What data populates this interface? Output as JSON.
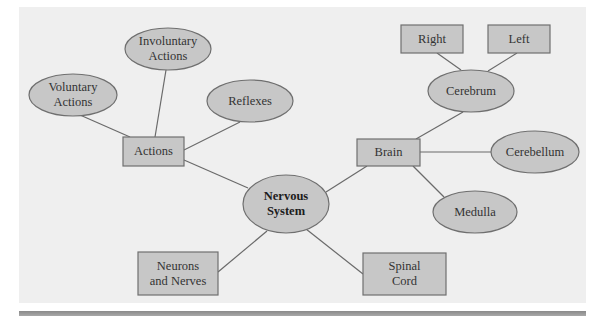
{
  "diagram": {
    "type": "concept-map",
    "colors": {
      "panel_bg": "#efefef",
      "node_fill": "#c7c7c7",
      "node_stroke": "#6f6f6f",
      "edge": "#6a6a6a",
      "bottom_rule": "#999999"
    },
    "nodes": {
      "nervous_system": {
        "shape": "ellipse",
        "line1": "Nervous",
        "line2": "System",
        "bold": true
      },
      "actions": {
        "shape": "rect",
        "line1": "Actions"
      },
      "voluntary_actions": {
        "shape": "ellipse",
        "line1": "Voluntary",
        "line2": "Actions"
      },
      "involuntary_actions": {
        "shape": "ellipse",
        "line1": "Involuntary",
        "line2": "Actions"
      },
      "reflexes": {
        "shape": "ellipse",
        "line1": "Reflexes"
      },
      "brain": {
        "shape": "rect",
        "line1": "Brain"
      },
      "cerebrum": {
        "shape": "ellipse",
        "line1": "Cerebrum"
      },
      "right": {
        "shape": "rect",
        "line1": "Right"
      },
      "left": {
        "shape": "rect",
        "line1": "Left"
      },
      "cerebellum": {
        "shape": "ellipse",
        "line1": "Cerebellum"
      },
      "medulla": {
        "shape": "ellipse",
        "line1": "Medulla"
      },
      "neurons_and_nerves": {
        "shape": "rect",
        "line1": "Neurons",
        "line2": "and Nerves"
      },
      "spinal_cord": {
        "shape": "rect",
        "line1": "Spinal",
        "line2": "Cord"
      }
    },
    "edges": [
      [
        "nervous_system",
        "actions"
      ],
      [
        "nervous_system",
        "brain"
      ],
      [
        "nervous_system",
        "neurons_and_nerves"
      ],
      [
        "nervous_system",
        "spinal_cord"
      ],
      [
        "actions",
        "voluntary_actions"
      ],
      [
        "actions",
        "involuntary_actions"
      ],
      [
        "actions",
        "reflexes"
      ],
      [
        "brain",
        "cerebrum"
      ],
      [
        "brain",
        "cerebellum"
      ],
      [
        "brain",
        "medulla"
      ],
      [
        "cerebrum",
        "right"
      ],
      [
        "cerebrum",
        "left"
      ]
    ]
  }
}
